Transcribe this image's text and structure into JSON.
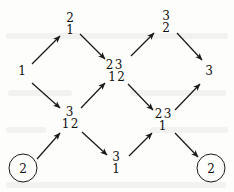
{
  "diagram": {
    "type": "directed-acyclic-graph",
    "orientation": "left-to-right",
    "style": {
      "ink": "#101010",
      "background": "#fdfdfc",
      "edge_color": "#1a1a1a"
    },
    "nodes": [
      {
        "id": "source",
        "name": "node-source-1",
        "shape": "plain",
        "x": 22,
        "y": 72,
        "rows": [
          [
            "1"
          ]
        ]
      },
      {
        "id": "upper-left",
        "name": "node-upper-left-21",
        "shape": "plain",
        "x": 70,
        "y": 24,
        "rows": [
          [
            "2"
          ],
          [
            "1"
          ]
        ]
      },
      {
        "id": "lower-left",
        "name": "node-lower-left-3-12",
        "shape": "plain",
        "x": 70,
        "y": 118,
        "rows": [
          [
            "3"
          ],
          [
            "1",
            "2"
          ]
        ]
      },
      {
        "id": "center",
        "name": "node-center-23-12",
        "shape": "plain",
        "x": 114,
        "y": 71,
        "rows": [
          [
            "2",
            "3"
          ],
          [
            "1",
            "2"
          ]
        ]
      },
      {
        "id": "upper-right",
        "name": "node-upper-right-32",
        "shape": "plain",
        "x": 166,
        "y": 22,
        "rows": [
          [
            "3"
          ],
          [
            "2"
          ]
        ]
      },
      {
        "id": "lower-right",
        "name": "node-lower-right-23-1",
        "shape": "plain",
        "x": 163,
        "y": 120,
        "rows": [
          [
            "2",
            "3"
          ],
          [
            "1"
          ]
        ]
      },
      {
        "id": "bottom-center",
        "name": "node-bottom-center-31",
        "shape": "plain",
        "x": 116,
        "y": 163,
        "rows": [
          [
            "3"
          ],
          [
            "1"
          ]
        ]
      },
      {
        "id": "sink",
        "name": "node-sink-3",
        "shape": "plain",
        "x": 209,
        "y": 72,
        "rows": [
          [
            "3"
          ]
        ]
      },
      {
        "id": "terminal-left",
        "name": "node-terminal-circled-2-left",
        "shape": "circle",
        "x": 23,
        "y": 168,
        "label": "2"
      },
      {
        "id": "terminal-right",
        "name": "node-terminal-circled-2-right",
        "shape": "circle",
        "x": 211,
        "y": 168,
        "label": "2"
      }
    ],
    "edges": [
      {
        "name": "edge-source-to-upper-left",
        "from": "source",
        "to": "upper-left",
        "x1": 32,
        "y1": 64,
        "x2": 60,
        "y2": 36
      },
      {
        "name": "edge-source-to-lower-left",
        "from": "source",
        "to": "lower-left",
        "x1": 32,
        "y1": 83,
        "x2": 60,
        "y2": 108
      },
      {
        "name": "edge-upper-left-to-center",
        "from": "upper-left",
        "to": "center",
        "x1": 80,
        "y1": 34,
        "x2": 105,
        "y2": 59
      },
      {
        "name": "edge-lower-left-to-center",
        "from": "lower-left",
        "to": "center",
        "x1": 81,
        "y1": 108,
        "x2": 105,
        "y2": 83
      },
      {
        "name": "edge-center-to-upper-right",
        "from": "center",
        "to": "upper-right",
        "x1": 131,
        "y1": 56,
        "x2": 154,
        "y2": 33
      },
      {
        "name": "edge-center-to-lower-right",
        "from": "center",
        "to": "lower-right",
        "x1": 128,
        "y1": 84,
        "x2": 153,
        "y2": 110
      },
      {
        "name": "edge-upper-right-to-sink",
        "from": "upper-right",
        "to": "sink",
        "x1": 177,
        "y1": 33,
        "x2": 202,
        "y2": 60
      },
      {
        "name": "edge-lower-right-to-sink",
        "from": "lower-right",
        "to": "sink",
        "x1": 175,
        "y1": 110,
        "x2": 200,
        "y2": 84
      },
      {
        "name": "edge-terminal-left-to-lower-left",
        "from": "terminal-left",
        "to": "lower-left",
        "x1": 37,
        "y1": 159,
        "x2": 60,
        "y2": 133
      },
      {
        "name": "edge-lower-left-to-bottom-center",
        "from": "lower-left",
        "to": "bottom-center",
        "x1": 82,
        "y1": 132,
        "x2": 107,
        "y2": 155
      },
      {
        "name": "edge-bottom-center-to-lower-right",
        "from": "bottom-center",
        "to": "lower-right",
        "x1": 129,
        "y1": 156,
        "x2": 152,
        "y2": 133
      },
      {
        "name": "edge-lower-right-to-terminal-right",
        "from": "lower-right",
        "to": "terminal-right",
        "x1": 175,
        "y1": 133,
        "x2": 198,
        "y2": 157
      }
    ],
    "scan_artifacts": [
      {
        "x": 6,
        "y": 33,
        "w": 222
      },
      {
        "x": 8,
        "y": 90,
        "w": 64
      },
      {
        "x": 130,
        "y": 90,
        "w": 96
      },
      {
        "x": 6,
        "y": 127,
        "w": 40
      },
      {
        "x": 150,
        "y": 127,
        "w": 78
      },
      {
        "x": 6,
        "y": 182,
        "w": 220
      }
    ]
  }
}
